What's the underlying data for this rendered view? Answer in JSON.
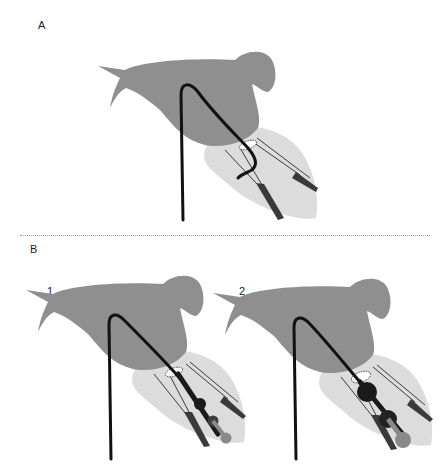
{
  "panels": {
    "a": {
      "label": "A"
    },
    "b": {
      "label": "B",
      "sub": [
        {
          "label": "1"
        },
        {
          "label": "2"
        }
      ]
    }
  },
  "colors": {
    "atrium": "#8f8f8f",
    "ventricle": "#dcdcdc",
    "catheter": "#111111",
    "papillary": "#3a3a3a",
    "balloon_dark": "#1a1a1a",
    "balloon_mid": "#3e3e3e",
    "balloon_light": "#8a8a8a"
  }
}
